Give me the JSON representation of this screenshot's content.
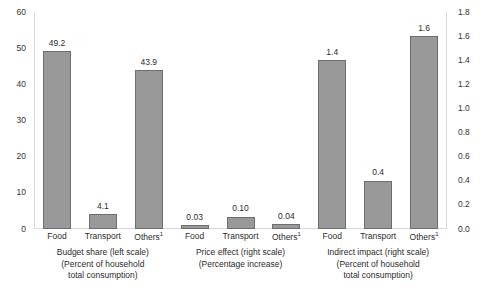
{
  "chart_data": {
    "type": "bar",
    "title": "",
    "subtitle": "",
    "xlabel": "",
    "ylabel": "",
    "grid": false,
    "legend": "none",
    "dual_axis": true,
    "left_axis": {
      "label": "",
      "ylim": [
        0,
        60
      ],
      "tick_step": 10,
      "ticks": [
        "0",
        "10",
        "20",
        "30",
        "40",
        "50",
        "60"
      ],
      "tick_values": [
        0,
        10,
        20,
        30,
        40,
        50,
        60
      ]
    },
    "right_axis": {
      "label": "",
      "ylim": [
        0.0,
        1.8
      ],
      "tick_step": 0.2,
      "ticks": [
        "0.0",
        "0.2",
        "0.4",
        "0.6",
        "0.8",
        "1.0",
        "1.2",
        "1.4",
        "1.6",
        "1.8"
      ],
      "tick_values": [
        0.0,
        0.2,
        0.4,
        0.6,
        0.8,
        1.0,
        1.2,
        1.4,
        1.6,
        1.8
      ]
    },
    "categories": [
      "Food",
      "Transport",
      "Others¹"
    ],
    "groups": [
      {
        "name": "Budget share",
        "scale": "left",
        "caption_lines": [
          "Budget share (left scale)",
          "(Percent of household",
          "total consumption)"
        ],
        "categories": [
          "Food",
          "Transport",
          "Others¹"
        ],
        "values": [
          49.2,
          4.1,
          43.9
        ],
        "labels": [
          "49.2",
          "4.1",
          "43.9"
        ]
      },
      {
        "name": "Price effect",
        "scale": "right",
        "caption_lines": [
          "Price effect (right scale)",
          "(Percentage increase)"
        ],
        "categories": [
          "Food",
          "Transport",
          "Others¹"
        ],
        "values": [
          0.03,
          0.1,
          0.04
        ],
        "labels": [
          "0.03",
          "0.10",
          "0.04"
        ]
      },
      {
        "name": "Indirect impact",
        "scale": "right",
        "caption_lines": [
          "Indirect impact (right scale)",
          "(Percent of household",
          "total consumption)"
        ],
        "categories": [
          "Food",
          "Transport",
          "Others¹"
        ],
        "values": [
          1.4,
          0.4,
          1.6
        ],
        "labels": [
          "1.4",
          "0.4",
          "1.6"
        ]
      }
    ],
    "series": [
      {
        "name": "Budget share (left scale)",
        "values": [
          49.2,
          4.1,
          43.9
        ]
      },
      {
        "name": "Price effect (right scale)",
        "values": [
          0.03,
          0.1,
          0.04
        ]
      },
      {
        "name": "Indirect impact (right scale)",
        "values": [
          1.4,
          0.4,
          1.6
        ]
      }
    ],
    "colors": {
      "bar_fill": "#999999",
      "bar_stroke": "#6e6e6e",
      "text": "#2b2b2b",
      "frame": "#d8d8d8",
      "background": "#ffffff"
    }
  }
}
